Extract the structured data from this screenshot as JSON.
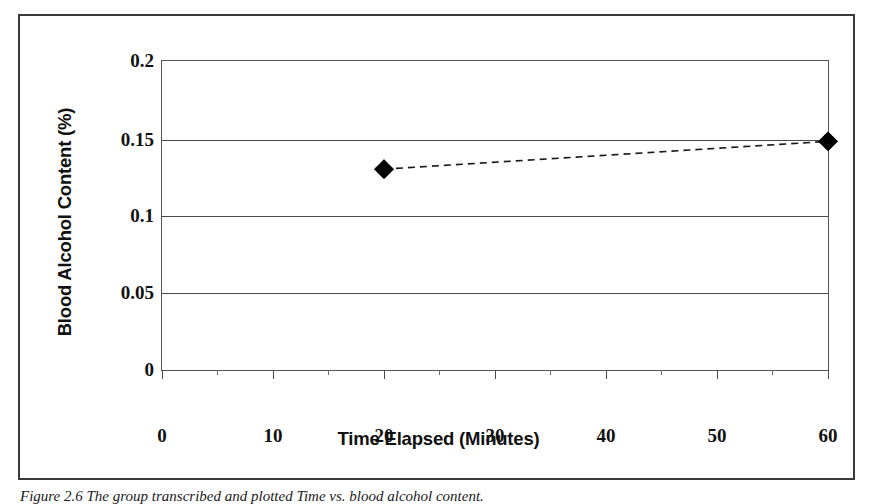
{
  "figure": {
    "caption_prefix": "Figure 2.6",
    "caption_text": "The group transcribed and plotted Time vs. blood alcohol content."
  },
  "chart_data": {
    "type": "line",
    "title": "",
    "xlabel": "Time Elapsed (Minutes)",
    "ylabel": "Blood Alcohol Content (%)",
    "xlim": [
      0,
      60
    ],
    "ylim": [
      0,
      0.2
    ],
    "grid": "horizontal",
    "legend": "none",
    "marker": "filled-diamond",
    "linestyle": "dashed",
    "line_color": "#1a1a1a",
    "marker_color": "#000000",
    "x_ticks": [
      0,
      10,
      20,
      30,
      40,
      50,
      60
    ],
    "x_tick_labels": [
      "0",
      "10",
      "20",
      "30",
      "40",
      "50",
      "60"
    ],
    "x_minor_ticks": [
      5,
      15,
      25,
      35,
      45,
      55
    ],
    "y_ticks": [
      0,
      0.05,
      0.1,
      0.15,
      0.2
    ],
    "y_tick_labels": [
      "0",
      "0.05",
      "0.1",
      "0.15",
      "0.2"
    ],
    "series": [
      {
        "name": "Blood Alcohol Content",
        "x": [
          20,
          60
        ],
        "y": [
          0.13,
          0.148
        ]
      }
    ]
  }
}
